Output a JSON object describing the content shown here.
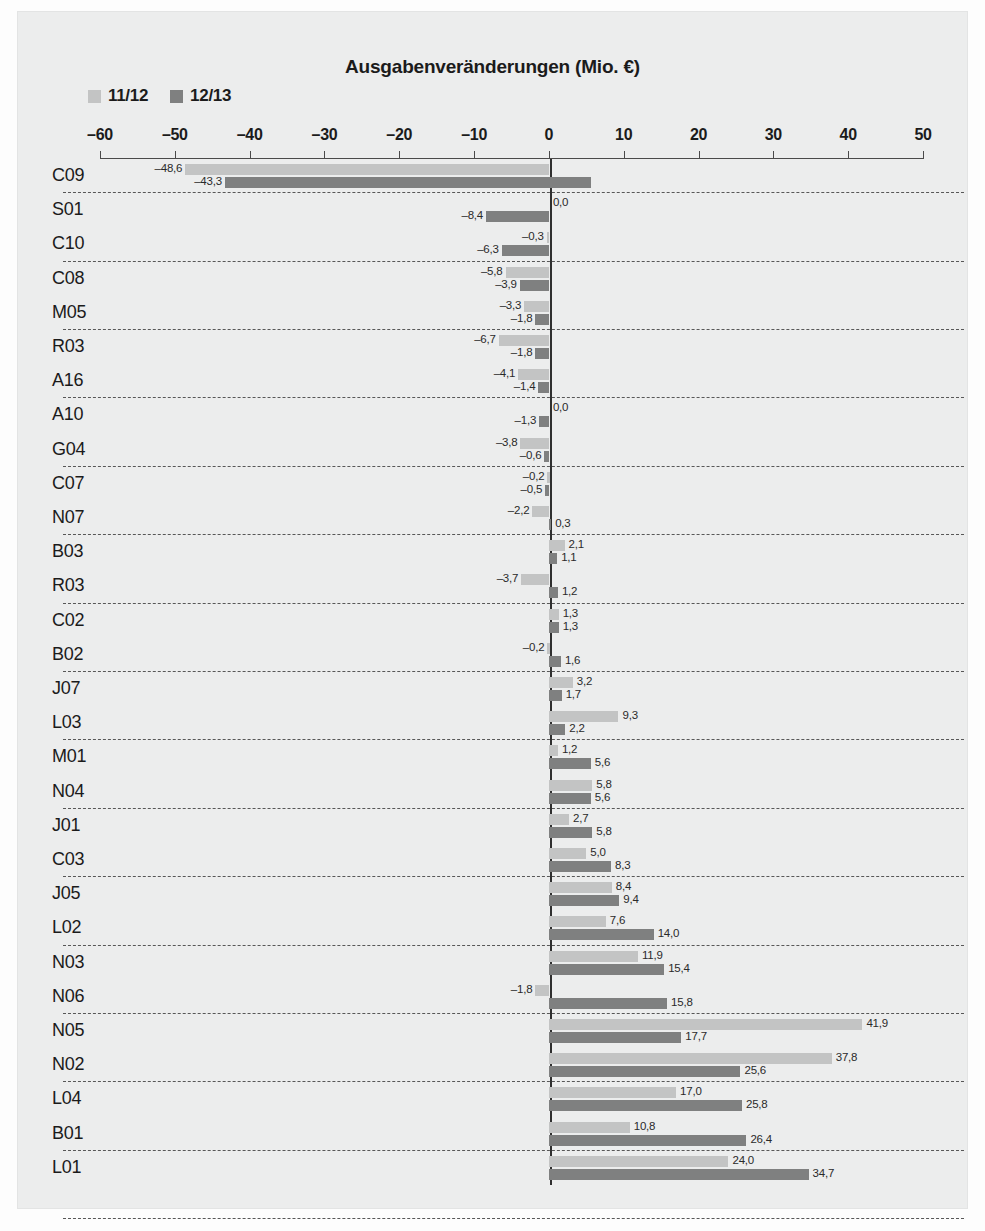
{
  "title": "Ausgabenveränderungen (Mio. €)",
  "legend": [
    {
      "label": "11/12",
      "color": "#c3c4c4",
      "key": "series1"
    },
    {
      "label": "12/13",
      "color": "#7f8080",
      "key": "series2"
    }
  ],
  "axis": {
    "ticks": [
      -60,
      -50,
      -40,
      -30,
      -20,
      -10,
      0,
      10,
      20,
      30,
      40,
      50
    ],
    "tick_labels": [
      "–60",
      "–50",
      "–40",
      "–30",
      "–20",
      "–10",
      "0",
      "10",
      "20",
      "30",
      "40",
      "50"
    ],
    "min": -60,
    "max": 50
  },
  "chart_data": {
    "type": "bar",
    "orientation": "horizontal",
    "title": "Ausgabenveränderungen (Mio. €)",
    "xlabel": "",
    "ylabel": "",
    "xlim": [
      -60,
      50
    ],
    "grid": "horizontal-dashed-row-separators",
    "legend_position": "top-left",
    "categories": [
      "C09",
      "S01",
      "C10",
      "C08",
      "M05",
      "R03",
      "A16",
      "A10",
      "G04",
      "C07",
      "N07",
      "B03",
      "R03",
      "C02",
      "B02",
      "J07",
      "L03",
      "M01",
      "N04",
      "J01",
      "C03",
      "J05",
      "L02",
      "N03",
      "N06",
      "N05",
      "N02",
      "L04",
      "B01",
      "L01"
    ],
    "series": [
      {
        "name": "11/12",
        "color": "#c3c4c4",
        "values": [
          -48.6,
          0.0,
          -0.3,
          -5.8,
          -3.3,
          -6.7,
          -4.1,
          0.0,
          -3.8,
          -0.2,
          -2.2,
          2.1,
          -3.7,
          1.3,
          -0.2,
          3.2,
          9.3,
          1.2,
          5.8,
          2.7,
          5.0,
          8.4,
          7.6,
          11.9,
          -1.8,
          41.9,
          37.8,
          17.0,
          10.8,
          24.0
        ],
        "labels": [
          "–48,6",
          "0,0",
          "–0,3",
          "–5,8",
          "–3,3",
          "–6,7",
          "–4,1",
          "0,0",
          "–3,8",
          "–0,2",
          "–2,2",
          "2,1",
          "–3,7",
          "1,3",
          "–0,2",
          "3,2",
          "9,3",
          "1,2",
          "5,8",
          "2,7",
          "5,0",
          "8,4",
          "7,6",
          "11,9",
          "–1,8",
          "41,9",
          "37,8",
          "17,0",
          "10,8",
          "24,0"
        ]
      },
      {
        "name": "12/13",
        "color": "#7f8080",
        "values": [
          -43.3,
          -8.4,
          -6.3,
          -3.9,
          -1.8,
          -1.8,
          -1.4,
          -1.3,
          -0.6,
          -0.5,
          0.3,
          1.1,
          1.2,
          1.3,
          1.6,
          1.7,
          2.2,
          5.6,
          5.6,
          5.8,
          8.3,
          9.4,
          14.0,
          15.4,
          15.8,
          17.7,
          25.6,
          25.8,
          26.4,
          34.7
        ],
        "labels": [
          "–43,3",
          "–8,4",
          "–6,3",
          "–3,9",
          "–1,8",
          "–1,8",
          "–1,4",
          "–1,3",
          "–0,6",
          "–0,5",
          "0,3",
          "1,1",
          "1,2",
          "1,3",
          "1,6",
          "1,7",
          "2,2",
          "5,6",
          "5,6",
          "5,8",
          "8,3",
          "9,4",
          "14,0",
          "15,4",
          "15,8",
          "17,7",
          "25,6",
          "25,8",
          "26,4",
          "34,7"
        ]
      }
    ]
  }
}
